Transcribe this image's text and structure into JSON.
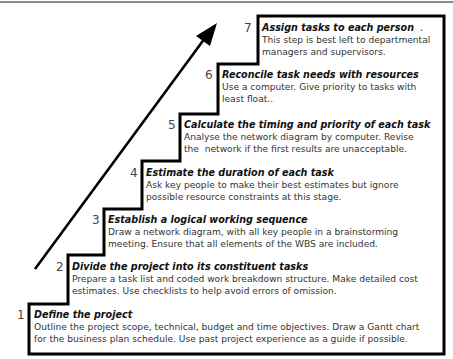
{
  "diagram": {
    "type": "staircase",
    "arrow": {
      "direction": "up-right",
      "color": "#000000"
    },
    "outline_color": "#000000",
    "steps": [
      {
        "number": "1",
        "title": "Define the project",
        "lines": [
          "Outline the project scope, technical, budget and time objectives. Draw a Gantt chart",
          "for the business plan schedule. Use past project experience as a guide if possible."
        ]
      },
      {
        "number": "2",
        "title": "Divide the project into its constituent tasks",
        "lines": [
          "Prepare a task list and coded work breakdown structure. Make detailed cost",
          "estimates. Use checklists to help avoid errors of omission."
        ]
      },
      {
        "number": "3",
        "title": "Establish a logical working sequence",
        "lines": [
          "Draw a network diagram, with all key people in a brainstorming",
          "meeting. Ensure that all elements of the WBS are included."
        ]
      },
      {
        "number": "4",
        "title": "Estimate the duration of each task",
        "lines": [
          "Ask key people to make their best estimates but ignore",
          "possible resource constraints at this stage."
        ]
      },
      {
        "number": "5",
        "title": "Calculate the timing and priority of each task",
        "lines": [
          "Analyse the network diagram by computer. Revise",
          "the  network if the first results are unacceptable."
        ]
      },
      {
        "number": "6",
        "title": "Reconcile task needs with resources",
        "lines": [
          "Use a computer. Give priority to tasks with",
          "least float.."
        ]
      },
      {
        "number": "7",
        "title": "Assign tasks to each person",
        "title_suffix": "  .",
        "lines": [
          "This step is best left to departmental",
          "managers and supervisors."
        ]
      }
    ]
  }
}
